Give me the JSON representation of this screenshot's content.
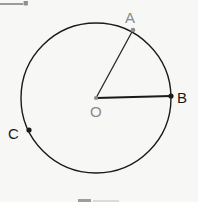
{
  "figure": {
    "background_color": "#f7f7f5",
    "stroke_color": "#1a1a1a",
    "center_marker_color": "#8a8a8a",
    "label_gray_color": "#8a8a8a"
  },
  "chart_data": {
    "type": "diagram",
    "shape": "circle",
    "title": "",
    "circle": {
      "center_label": "O",
      "center_x": 96,
      "center_y": 98,
      "radius": 75,
      "stroke": "#1a1a1a",
      "stroke_width": 1.4,
      "fill": "none"
    },
    "points": [
      {
        "label": "A",
        "x": 133,
        "y": 30,
        "on_circle": true,
        "dot_color": "#8a8a8a",
        "label_color": "#8a8a8a",
        "label_position": "above"
      },
      {
        "label": "B",
        "x": 171,
        "y": 96,
        "on_circle": true,
        "dot_color": "#1a1a1a",
        "label_color": "#1a1a1a",
        "label_position": "right"
      },
      {
        "label": "C",
        "x": 29,
        "y": 130,
        "on_circle": true,
        "dot_color": "#1a1a1a",
        "label_color": "#1a1a1a",
        "label_position": "left"
      }
    ],
    "radii": [
      {
        "name": "OA",
        "from": "O",
        "to": "A",
        "stroke": "#2a2a2a",
        "stroke_width": 1.3
      },
      {
        "name": "OB",
        "from": "O",
        "to": "B",
        "stroke": "#1a1a1a",
        "stroke_width": 1.8
      }
    ],
    "labels": {
      "A": "A",
      "B": "B",
      "C": "C",
      "O": "O"
    }
  },
  "artifacts": {
    "top_rule_present": true,
    "top_glyph_text": "■",
    "bottom_glyph_present": true
  }
}
